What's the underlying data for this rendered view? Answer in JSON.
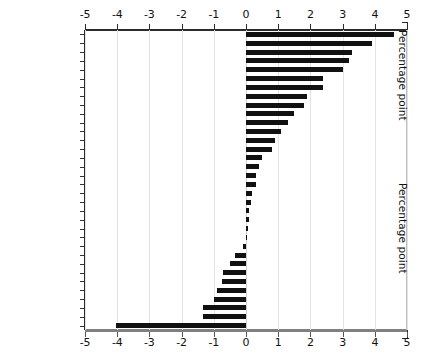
{
  "chart_data": {
    "type": "bar",
    "orientation": "horizontal",
    "title": "",
    "subtitle": "",
    "xlabel": "Percentage point",
    "ylabel": "",
    "xlim": [
      -5,
      5
    ],
    "xticks": [
      -5,
      -4,
      -3,
      -2,
      -1,
      0,
      1,
      2,
      3,
      4,
      5
    ],
    "xticklabels": [
      "-5",
      "-4",
      "-3",
      "-2",
      "-1",
      "0",
      "1",
      "2",
      "3",
      "4",
      "5"
    ],
    "grid": true,
    "grid_axis": "x",
    "legend": false,
    "axis_titles_right": [
      "Percentage point",
      "Percentage point"
    ],
    "bar_color": "#111111",
    "grid_color": "#e3e3e3",
    "axis_color": "#2b2b2b",
    "categories": [
      "Portugal",
      "Mexico",
      "Slovakia",
      "Luxembourg",
      "Iceland",
      "Japan",
      "Spain",
      "South Korea",
      "Ireland",
      "Poland",
      "USA",
      "Turkey",
      "Austria",
      "Italy",
      "Estonia",
      "Australia",
      "Finland",
      "Canada",
      "Czech Republic",
      "Greece",
      "Belgium",
      "Slovenia",
      "Norway",
      "Switzerland",
      "Chile",
      "Sweden",
      "Israel",
      "France",
      "United Kingdom",
      "Netherlands",
      "New Zealand",
      "Denmark",
      "Germany",
      "Hungary"
    ],
    "values": [
      4.6,
      3.9,
      3.3,
      3.2,
      3.0,
      2.4,
      2.4,
      1.9,
      1.8,
      1.5,
      1.3,
      1.1,
      0.9,
      0.8,
      0.5,
      0.4,
      0.3,
      0.3,
      0.2,
      0.15,
      0.1,
      0.08,
      0.05,
      0.0,
      -0.1,
      -0.35,
      -0.5,
      -0.7,
      -0.75,
      -0.9,
      -1.0,
      -1.35,
      -1.35,
      -4.05
    ]
  },
  "caption": ""
}
